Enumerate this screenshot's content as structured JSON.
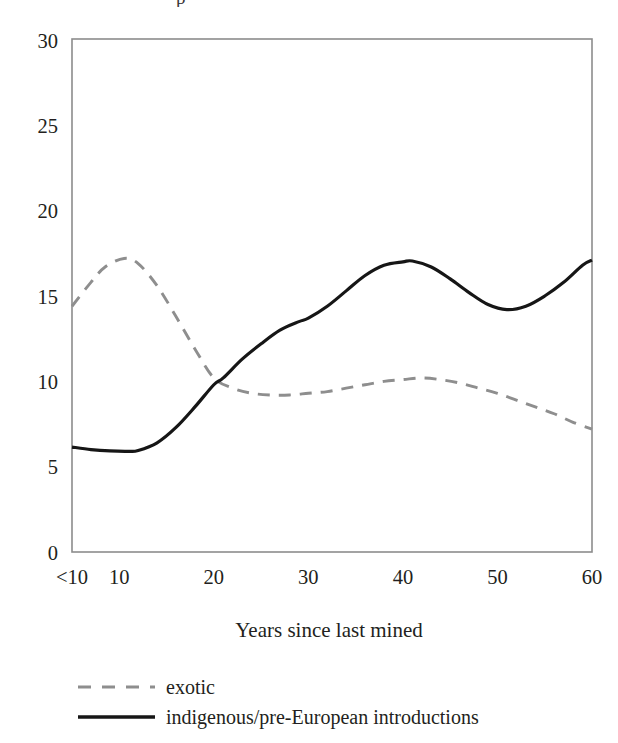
{
  "figure": {
    "clipped_top_glyph": "p",
    "frame_color": "#8c8c8c",
    "background": "#ffffff"
  },
  "chart_data": {
    "type": "line",
    "title": "",
    "xlabel": "Years since last mined",
    "ylabel": "",
    "xtick_labels": [
      "<10",
      "10",
      "20",
      "30",
      "40",
      "50",
      "60"
    ],
    "xtick_values": [
      5,
      10,
      20,
      30,
      40,
      50,
      60
    ],
    "ytick_labels": [
      "0",
      "5",
      "10",
      "15",
      "20",
      "25",
      "30"
    ],
    "ylim": [
      0,
      30
    ],
    "xlim": [
      5,
      60
    ],
    "grid": false,
    "legend_position": "below-axis-left",
    "series": [
      {
        "name": "exotic",
        "style": "dashed",
        "color": "#8e8e8e",
        "x": [
          5,
          7,
          8.5,
          10.5,
          12,
          14,
          16,
          18,
          20,
          22,
          24,
          26,
          28,
          30,
          32,
          34,
          36,
          38,
          40,
          42,
          44,
          46,
          48,
          50,
          52,
          54,
          56,
          58,
          60
        ],
        "values": [
          14.4,
          15.8,
          16.7,
          17.2,
          16.9,
          15.6,
          13.8,
          11.9,
          10.2,
          9.6,
          9.3,
          9.2,
          9.2,
          9.3,
          9.4,
          9.6,
          9.8,
          10.0,
          10.1,
          10.2,
          10.1,
          9.9,
          9.6,
          9.3,
          8.9,
          8.5,
          8.1,
          7.6,
          7.2
        ]
      },
      {
        "name": "indigenous/pre-European introductions",
        "style": "solid",
        "color": "#161616",
        "x": [
          5,
          7,
          9,
          11,
          12,
          14,
          16,
          18,
          20,
          21,
          23,
          25,
          27,
          29,
          30,
          32,
          34,
          36,
          38,
          40,
          41,
          43,
          45,
          47,
          49,
          51,
          53,
          55,
          57,
          59,
          60
        ],
        "values": [
          6.15,
          6.0,
          5.92,
          5.9,
          5.95,
          6.4,
          7.3,
          8.5,
          9.8,
          10.2,
          11.3,
          12.2,
          13.0,
          13.5,
          13.7,
          14.4,
          15.3,
          16.2,
          16.8,
          17.0,
          17.05,
          16.7,
          16.0,
          15.2,
          14.5,
          14.2,
          14.4,
          15.0,
          15.8,
          16.8,
          17.1
        ]
      }
    ]
  },
  "legend": {
    "items": [
      {
        "label": "exotic",
        "style": "dashed",
        "color": "#8e8e8e"
      },
      {
        "label": "indigenous/pre-European introductions",
        "style": "solid",
        "color": "#161616"
      }
    ]
  }
}
